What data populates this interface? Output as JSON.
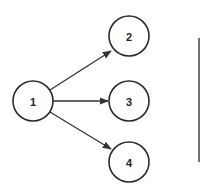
{
  "diagram": {
    "type": "directed-graph",
    "nodes": [
      {
        "id": "1",
        "label": "1",
        "cx": 33,
        "cy": 101
      },
      {
        "id": "2",
        "label": "2",
        "cx": 129,
        "cy": 36
      },
      {
        "id": "3",
        "label": "3",
        "cx": 129,
        "cy": 101
      },
      {
        "id": "4",
        "label": "4",
        "cx": 129,
        "cy": 162
      }
    ],
    "edges": [
      {
        "from": "1",
        "to": "2"
      },
      {
        "from": "1",
        "to": "3"
      },
      {
        "from": "1",
        "to": "4"
      }
    ],
    "node_radius": 20,
    "stroke_color": "#2a2a2a"
  }
}
